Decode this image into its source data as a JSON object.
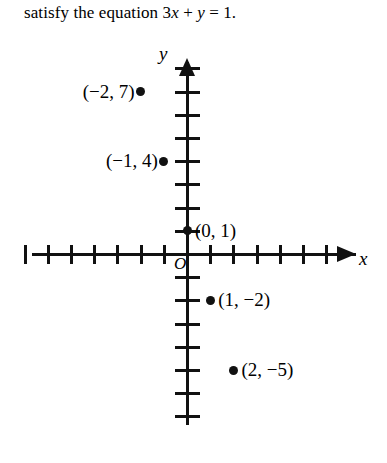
{
  "caption": {
    "prefix": "satisfy the equation ",
    "coefficient": "3",
    "var_x": "x",
    "plus": " + ",
    "var_y": "y",
    "equals": " = ",
    "rhs": "1",
    "period": "."
  },
  "axes": {
    "x_label": "x",
    "y_label": "y",
    "origin_label": "O"
  },
  "points": [
    {
      "label": "(−2, 7)",
      "x": -2,
      "y": 7,
      "label_side": "left"
    },
    {
      "label": "(−1, 4)",
      "x": -1,
      "y": 4,
      "label_side": "left"
    },
    {
      "label": "(0, 1)",
      "x": 0,
      "y": 1,
      "label_side": "right"
    },
    {
      "label": "(1, −2)",
      "x": 1,
      "y": -2,
      "label_side": "right"
    },
    {
      "label": "(2, −5)",
      "x": 2,
      "y": -5,
      "label_side": "right"
    }
  ],
  "chart_data": {
    "type": "scatter",
    "title": "",
    "xlabel": "x",
    "ylabel": "y",
    "grid": false,
    "legend": "none",
    "equation": "3x + y = 1",
    "x": [
      -2,
      -1,
      0,
      1,
      2
    ],
    "y": [
      7,
      4,
      1,
      -2,
      -5
    ],
    "point_labels": [
      "(−2, 7)",
      "(−1, 4)",
      "(0, 1)",
      "(1, −2)",
      "(2, −5)"
    ],
    "xlim": [
      -7,
      7
    ],
    "ylim": [
      -7,
      8
    ],
    "xticks": [
      -7,
      -6,
      -5,
      -4,
      -3,
      -2,
      -1,
      1,
      2,
      3,
      4,
      5,
      6
    ],
    "yticks": [
      -7,
      -6,
      -5,
      -4,
      -3,
      -2,
      -1,
      1,
      2,
      3,
      4,
      5,
      6,
      7,
      8
    ],
    "axis_color": "#111111",
    "background": "#ffffff"
  },
  "geometry": {
    "origin_px": {
      "x": 187,
      "y": 254
    },
    "unit_px": {
      "x": 23.2,
      "y": 23.2
    }
  }
}
